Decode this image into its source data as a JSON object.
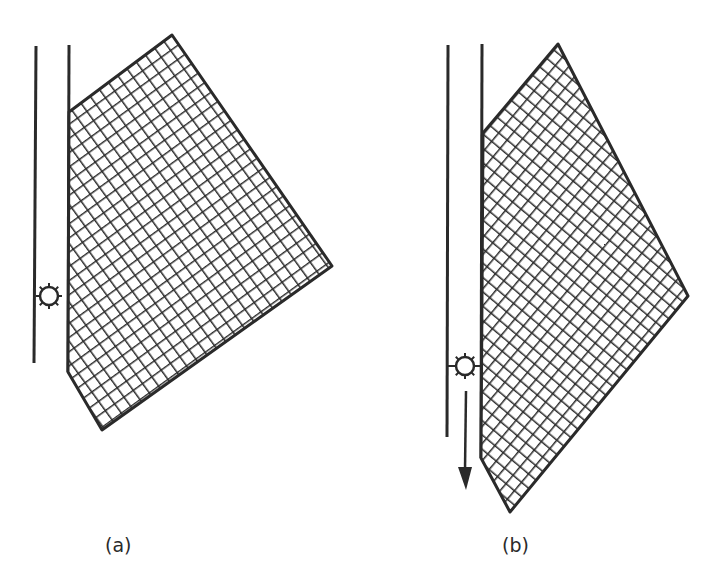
{
  "figure": {
    "panels": [
      {
        "id": "a",
        "label": "(a)",
        "description": "Grid plate hanging beside a vertical rail with a gear wheel"
      },
      {
        "id": "b",
        "label": "(b)",
        "description": "Grid plate displaced downward; gear wheel with downward arrow"
      }
    ],
    "colors": {
      "ink": "#2a2a2a",
      "background": "#ffffff"
    }
  }
}
